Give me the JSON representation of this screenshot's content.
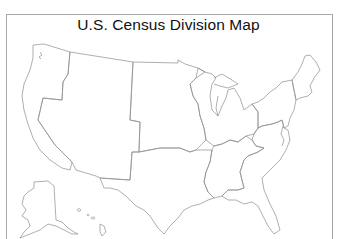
{
  "title": "U.S. Census Division Map",
  "map": {
    "stroke_color": "#8c8c8c",
    "background": "#ffffff",
    "divisions": [
      {
        "id": "pacific",
        "name": "Pacific"
      },
      {
        "id": "mountain",
        "name": "Mountain"
      },
      {
        "id": "west-north-central",
        "name": "West North Central"
      },
      {
        "id": "west-south-central",
        "name": "West South Central"
      },
      {
        "id": "east-north-central",
        "name": "East North Central"
      },
      {
        "id": "east-south-central",
        "name": "East South Central"
      },
      {
        "id": "south-atlantic",
        "name": "South Atlantic"
      },
      {
        "id": "middle-atlantic",
        "name": "Middle Atlantic"
      },
      {
        "id": "new-england",
        "name": "New England"
      }
    ],
    "insets": [
      "Alaska",
      "Hawaii"
    ]
  }
}
